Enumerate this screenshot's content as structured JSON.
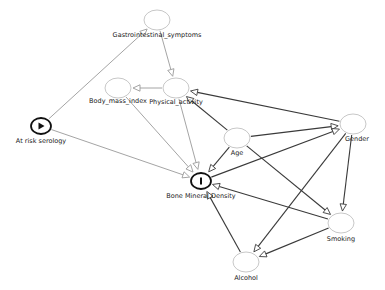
{
  "diagram": {
    "type": "causal-dag",
    "nodes": [
      {
        "id": "gi",
        "label": "Gastrointestinal_symptoms",
        "x": 157,
        "y": 20,
        "kind": "latent",
        "lx": 157,
        "ly": 32
      },
      {
        "id": "bmi",
        "label": "Body_mass_index",
        "x": 118,
        "y": 88,
        "kind": "latent",
        "lx": 118,
        "ly": 98
      },
      {
        "id": "pa",
        "label": "Physical_activity",
        "x": 176,
        "y": 88,
        "kind": "latent",
        "lx": 176,
        "ly": 99
      },
      {
        "id": "ars",
        "label": "At risk serology",
        "x": 41,
        "y": 126,
        "kind": "exposure",
        "lx": 41,
        "ly": 138
      },
      {
        "id": "age",
        "label": "Age",
        "x": 237,
        "y": 138,
        "kind": "latent",
        "lx": 237,
        "ly": 150
      },
      {
        "id": "gender",
        "label": "Gender",
        "x": 353,
        "y": 124,
        "kind": "latent",
        "lx": 357,
        "ly": 136
      },
      {
        "id": "bmd",
        "label": "Bone Mineral Density",
        "x": 201,
        "y": 181,
        "kind": "outcome",
        "lx": 201,
        "ly": 193
      },
      {
        "id": "smoking",
        "label": "Smoking",
        "x": 341,
        "y": 223,
        "kind": "latent",
        "lx": 341,
        "ly": 236
      },
      {
        "id": "alcohol",
        "label": "Alcohol",
        "x": 246,
        "y": 262,
        "kind": "latent",
        "lx": 246,
        "ly": 275
      }
    ],
    "edges": [
      {
        "from": "ars",
        "to": "gi",
        "style": "light"
      },
      {
        "from": "ars",
        "to": "bmd",
        "style": "light"
      },
      {
        "from": "gi",
        "to": "pa",
        "style": "light"
      },
      {
        "from": "pa",
        "to": "bmi",
        "style": "light"
      },
      {
        "from": "pa",
        "to": "bmd",
        "style": "light"
      },
      {
        "from": "bmi",
        "to": "bmd",
        "style": "light"
      },
      {
        "from": "age",
        "to": "pa",
        "style": "dark"
      },
      {
        "from": "gender",
        "to": "pa",
        "style": "dark"
      },
      {
        "from": "age",
        "to": "gender",
        "style": "dark"
      },
      {
        "from": "bmd",
        "to": "gender",
        "style": "dark"
      },
      {
        "from": "age",
        "to": "bmd",
        "style": "dark"
      },
      {
        "from": "age",
        "to": "smoking",
        "style": "dark"
      },
      {
        "from": "gender",
        "to": "smoking",
        "style": "dark"
      },
      {
        "from": "gender",
        "to": "alcohol",
        "style": "dark"
      },
      {
        "from": "smoking",
        "to": "bmd",
        "style": "dark"
      },
      {
        "from": "smoking",
        "to": "alcohol",
        "style": "dark"
      },
      {
        "from": "alcohol",
        "to": "bmd",
        "style": "dark"
      }
    ],
    "colors": {
      "light_edge": "#9a9a9a",
      "dark_edge": "#3a3a3a",
      "node_outline": "#c8c8c8",
      "key_node_outline": "#111111",
      "label": "#222222"
    },
    "icons": {
      "exposure": "play-triangle-icon",
      "outcome": "bar-I-icon"
    }
  }
}
